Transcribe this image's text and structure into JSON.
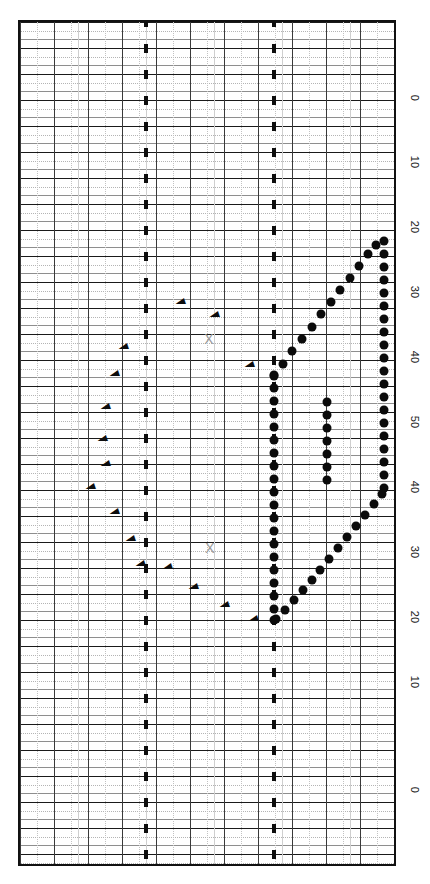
{
  "chart_data": {
    "type": "scatter",
    "title": "",
    "subtitle": "",
    "orientation": "rotated-90",
    "xlabel": "",
    "ylabel": "",
    "grid": true,
    "legend": null,
    "axis": {
      "name": "value-axis",
      "side": "right",
      "tick_labels": [
        "0",
        "10",
        "20",
        "30",
        "40",
        "50",
        "40",
        "30",
        "20",
        "10",
        "0"
      ],
      "tick_values": [
        0,
        10,
        20,
        30,
        40,
        50,
        40,
        30,
        20,
        10,
        0
      ],
      "tick_positions_px": [
        98,
        162,
        227,
        292,
        357,
        422,
        487,
        552,
        617,
        682,
        790
      ],
      "symmetric": true,
      "range_note": "axis rises 0 to 50 then mirrors back down to 0"
    },
    "grid_spec": {
      "major_row_step_px": 26,
      "minor_rows_per_major": 2,
      "vertical_major_step_px": 34,
      "vertical_minor_step_px": 17,
      "tick_columns_px": [
        144,
        272
      ]
    },
    "series": [
      {
        "name": "primary-vertical-cluster",
        "marker": "filled-circle",
        "color": "#0b0b0b",
        "description": "dense vertical column of points",
        "points": [
          [
            272,
            373
          ],
          [
            272,
            386
          ],
          [
            272,
            399
          ],
          [
            272,
            412
          ],
          [
            272,
            425
          ],
          [
            272,
            438
          ],
          [
            272,
            451
          ],
          [
            272,
            464
          ],
          [
            272,
            477
          ],
          [
            272,
            490
          ],
          [
            272,
            503
          ],
          [
            272,
            516
          ],
          [
            272,
            529
          ],
          [
            272,
            542
          ],
          [
            272,
            555
          ],
          [
            272,
            568
          ],
          [
            272,
            581
          ],
          [
            272,
            594
          ],
          [
            272,
            607
          ],
          [
            272,
            618
          ]
        ]
      },
      {
        "name": "right-edge-vertical-cluster",
        "marker": "filled-circle",
        "color": "#0b0b0b",
        "description": "dense vertical column at right margin",
        "points": [
          [
            382,
            239
          ],
          [
            382,
            252
          ],
          [
            382,
            265
          ],
          [
            382,
            278
          ],
          [
            382,
            291
          ],
          [
            382,
            304
          ],
          [
            382,
            317
          ],
          [
            382,
            330
          ],
          [
            382,
            343
          ],
          [
            382,
            356
          ],
          [
            382,
            369
          ],
          [
            382,
            382
          ],
          [
            382,
            395
          ],
          [
            382,
            408
          ],
          [
            382,
            421
          ],
          [
            382,
            434
          ],
          [
            382,
            447
          ],
          [
            382,
            460
          ],
          [
            382,
            473
          ],
          [
            382,
            486
          ]
        ]
      },
      {
        "name": "middle-short-cluster",
        "marker": "filled-circle",
        "color": "#0b0b0b",
        "description": "short vertical run in mid field",
        "points": [
          [
            325,
            400
          ],
          [
            325,
            413
          ],
          [
            325,
            426
          ],
          [
            325,
            439
          ],
          [
            325,
            452
          ],
          [
            325,
            465
          ],
          [
            325,
            478
          ]
        ]
      },
      {
        "name": "upper-diagonal",
        "marker": "filled-circle",
        "color": "#0b0b0b",
        "description": "diagonal trail rising to the upper right",
        "points": [
          [
            272,
            374
          ],
          [
            281,
            362
          ],
          [
            290,
            349
          ],
          [
            300,
            337
          ],
          [
            310,
            325
          ],
          [
            319,
            312
          ],
          [
            329,
            300
          ],
          [
            338,
            288
          ],
          [
            348,
            276
          ],
          [
            357,
            264
          ],
          [
            366,
            252
          ],
          [
            374,
            243
          ]
        ]
      },
      {
        "name": "lower-diagonal",
        "marker": "filled-circle",
        "color": "#0b0b0b",
        "description": "diagonal trail rising from the lower left",
        "points": [
          [
            274,
            617
          ],
          [
            283,
            608
          ],
          [
            292,
            598
          ],
          [
            301,
            588
          ],
          [
            310,
            578
          ],
          [
            318,
            568
          ],
          [
            327,
            557
          ],
          [
            336,
            546
          ],
          [
            345,
            535
          ],
          [
            354,
            524
          ],
          [
            363,
            513
          ],
          [
            372,
            502
          ],
          [
            380,
            492
          ]
        ]
      }
    ],
    "annotations": {
      "x_markers": [
        {
          "name": "x-marker-upper",
          "x": 207,
          "y": 337,
          "label": "X",
          "color": "#9a9a9a"
        },
        {
          "name": "x-marker-lower",
          "x": 208,
          "y": 546,
          "label": "X",
          "color": "#9a9a9a"
        }
      ],
      "caret_markers": [
        {
          "x": 178,
          "y": 300
        },
        {
          "x": 212,
          "y": 313
        },
        {
          "x": 247,
          "y": 363
        },
        {
          "x": 121,
          "y": 345
        },
        {
          "x": 112,
          "y": 372
        },
        {
          "x": 103,
          "y": 405
        },
        {
          "x": 100,
          "y": 437
        },
        {
          "x": 103,
          "y": 462
        },
        {
          "x": 88,
          "y": 485
        },
        {
          "x": 112,
          "y": 510
        },
        {
          "x": 128,
          "y": 537
        },
        {
          "x": 138,
          "y": 562
        },
        {
          "x": 165,
          "y": 565
        },
        {
          "x": 191,
          "y": 585
        },
        {
          "x": 222,
          "y": 603
        },
        {
          "x": 251,
          "y": 617
        }
      ],
      "caret_glyph": "◄"
    }
  },
  "caption": {
    "text": "",
    "visible": false
  },
  "colors": {
    "ink": "#0b0b0b",
    "grid_major": "#1a1a1a",
    "grid_mid": "#8e8e8e",
    "grid_minor": "#b4b4b4",
    "marker_x": "#9a9a9a",
    "background": "#ffffff"
  }
}
